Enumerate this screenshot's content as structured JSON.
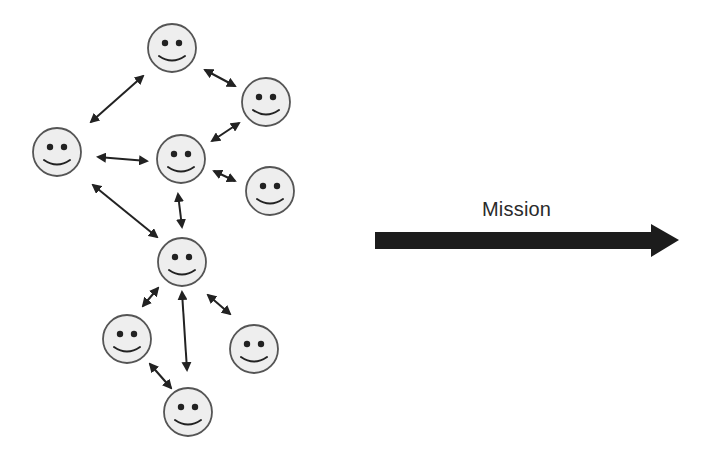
{
  "diagram": {
    "mission_label": "Mission",
    "colors": {
      "background": "#ffffff",
      "face_fill": "#eeeeee",
      "face_stroke": "#555555",
      "feature": "#222222",
      "arrow": "#222222",
      "mission_arrow": "#1c1c1c",
      "text": "#2a2a2a"
    },
    "face_radius": 24,
    "faces": [
      {
        "id": "top",
        "icon": "smiley-face-icon",
        "cx": 172,
        "cy": 48
      },
      {
        "id": "upper-right",
        "icon": "smiley-face-icon",
        "cx": 266,
        "cy": 102
      },
      {
        "id": "left",
        "icon": "smiley-face-icon",
        "cx": 57,
        "cy": 152
      },
      {
        "id": "center",
        "icon": "smiley-face-icon",
        "cx": 181,
        "cy": 159
      },
      {
        "id": "middle-right",
        "icon": "smiley-face-icon",
        "cx": 270,
        "cy": 191
      },
      {
        "id": "hub",
        "icon": "smiley-face-icon",
        "cx": 182,
        "cy": 262
      },
      {
        "id": "lower-left",
        "icon": "smiley-face-icon",
        "cx": 127,
        "cy": 339
      },
      {
        "id": "lower-right",
        "icon": "smiley-face-icon",
        "cx": 254,
        "cy": 349
      },
      {
        "id": "bottom",
        "icon": "smiley-face-icon",
        "cx": 188,
        "cy": 412
      }
    ],
    "links": [
      {
        "from": "top",
        "to": "left",
        "x1": 143,
        "y1": 76,
        "x2": 91,
        "y2": 122
      },
      {
        "from": "top",
        "to": "upper-right",
        "x1": 205,
        "y1": 70,
        "x2": 235,
        "y2": 86
      },
      {
        "from": "center",
        "to": "upper-right",
        "x1": 212,
        "y1": 141,
        "x2": 239,
        "y2": 123
      },
      {
        "from": "left",
        "to": "center",
        "x1": 98,
        "y1": 157,
        "x2": 147,
        "y2": 161
      },
      {
        "from": "center",
        "to": "middle-right",
        "x1": 214,
        "y1": 171,
        "x2": 235,
        "y2": 181
      },
      {
        "from": "left",
        "to": "hub",
        "x1": 93,
        "y1": 185,
        "x2": 157,
        "y2": 237
      },
      {
        "from": "center",
        "to": "hub",
        "x1": 178,
        "y1": 194,
        "x2": 182,
        "y2": 227
      },
      {
        "from": "hub",
        "to": "lower-left",
        "x1": 158,
        "y1": 288,
        "x2": 143,
        "y2": 306
      },
      {
        "from": "hub",
        "to": "bottom",
        "x1": 182,
        "y1": 292,
        "x2": 187,
        "y2": 370
      },
      {
        "from": "hub",
        "to": "lower-right",
        "x1": 208,
        "y1": 295,
        "x2": 230,
        "y2": 314
      },
      {
        "from": "lower-left",
        "to": "bottom",
        "x1": 150,
        "y1": 364,
        "x2": 171,
        "y2": 388
      }
    ],
    "mission_arrow": {
      "icon": "right-arrow-icon",
      "shaft_x1": 375,
      "shaft_x2": 651,
      "shaft_y_top": 232,
      "shaft_y_bottom": 249,
      "head_top": 224,
      "head_bottom": 257,
      "tip_x": 679,
      "tip_y": 240
    }
  }
}
